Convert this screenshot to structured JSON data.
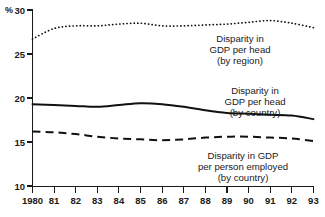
{
  "chart_data": {
    "type": "line",
    "title": "",
    "subtitle": "",
    "xlabel": "",
    "ylabel": "%",
    "unit_label": "%",
    "grid": false,
    "legend_position": "inline-annotations",
    "xlim": [
      1980,
      1993
    ],
    "ylim": [
      10,
      30
    ],
    "ytick_values": [
      30,
      25,
      20,
      15,
      10
    ],
    "ytick_labels": [
      "30",
      "25",
      "20",
      "15",
      "10"
    ],
    "x": [
      1980,
      1981,
      1982,
      1983,
      1984,
      1985,
      1986,
      1987,
      1988,
      1989,
      1990,
      1991,
      1992,
      1993
    ],
    "xtick_labels": [
      "1980",
      "81",
      "82",
      "83",
      "84",
      "85",
      "86",
      "87",
      "88",
      "89",
      "90",
      "91",
      "92",
      "93"
    ],
    "series": [
      {
        "name": "Disparity in GDP per head (by region)",
        "style": "dotted",
        "values": [
          26.7,
          27.9,
          28.2,
          28.2,
          28.4,
          28.5,
          28.2,
          28.2,
          28.3,
          28.4,
          28.6,
          28.8,
          28.5,
          28.0
        ]
      },
      {
        "name": "Disparity in GDP per head (by country)",
        "style": "solid",
        "values": [
          19.3,
          19.2,
          19.1,
          19.0,
          19.2,
          19.4,
          19.3,
          19.0,
          18.6,
          18.3,
          18.2,
          18.1,
          18.0,
          17.6
        ]
      },
      {
        "name": "Disparity in GDP per person employed (by country)",
        "style": "dashed",
        "values": [
          16.2,
          16.1,
          15.9,
          15.6,
          15.4,
          15.3,
          15.2,
          15.3,
          15.5,
          15.6,
          15.6,
          15.5,
          15.4,
          15.1
        ]
      }
    ],
    "annotations": [
      {
        "id": "region",
        "lines": [
          "Disparity in",
          "GDP per head",
          "(by region)"
        ]
      },
      {
        "id": "country-head",
        "lines": [
          "Disparity in",
          "GDP per head",
          "(by country)"
        ]
      },
      {
        "id": "country-employed",
        "lines": [
          "Disparity in GDP",
          "per person employed",
          "(by country)"
        ]
      }
    ],
    "colors": {
      "line": "#111111",
      "axis": "#1a1a1a",
      "background": "#ffffff"
    }
  }
}
